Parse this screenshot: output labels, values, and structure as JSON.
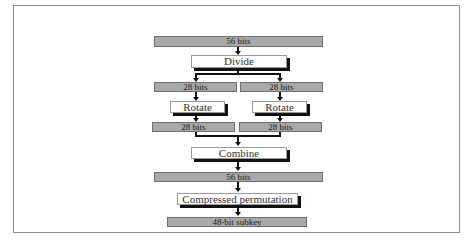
{
  "diagram": {
    "type": "flowchart",
    "colors": {
      "bar_fill": "#a9a9a9",
      "bar_border": "#6f6f6f",
      "box_fill": "#ffffff",
      "shadow": "#111111",
      "frame": "#8c8c8c"
    },
    "nodes": {
      "input": {
        "label": "56 bits"
      },
      "divide": {
        "label": "Divide"
      },
      "left_half": {
        "label": "28 bits"
      },
      "right_half": {
        "label": "28 bits"
      },
      "rotate_left": {
        "label": "Rotate"
      },
      "rotate_right": {
        "label": "Rotate"
      },
      "left_rotated": {
        "label": "28 bits"
      },
      "right_rotated": {
        "label": "28 bits"
      },
      "combine": {
        "label": "Combine"
      },
      "combined": {
        "label": "56 bits"
      },
      "compress": {
        "label": "Compressed permutation"
      },
      "output": {
        "label": "48-bit subkey"
      }
    },
    "edges": [
      [
        "input",
        "divide"
      ],
      [
        "divide",
        "left_half"
      ],
      [
        "divide",
        "right_half"
      ],
      [
        "left_half",
        "rotate_left"
      ],
      [
        "right_half",
        "rotate_right"
      ],
      [
        "rotate_left",
        "left_rotated"
      ],
      [
        "rotate_right",
        "right_rotated"
      ],
      [
        "left_rotated",
        "combine"
      ],
      [
        "right_rotated",
        "combine"
      ],
      [
        "combine",
        "combined"
      ],
      [
        "combined",
        "compress"
      ],
      [
        "compress",
        "output"
      ]
    ]
  }
}
